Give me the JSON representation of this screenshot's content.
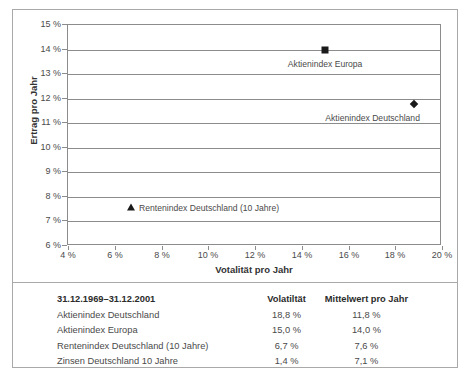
{
  "chart_data": {
    "type": "scatter",
    "title": "",
    "xlabel": "Votalität pro Jahr",
    "ylabel": "Ertrag pro Jahr",
    "xlim": [
      4,
      20
    ],
    "ylim": [
      6,
      15
    ],
    "xticks": [
      "4 %",
      "6 %",
      "8 %",
      "10 %",
      "12 %",
      "14 %",
      "16 %",
      "18 %",
      "20 %"
    ],
    "xtick_values": [
      4,
      6,
      8,
      10,
      12,
      14,
      16,
      18,
      20
    ],
    "yticks": [
      "6 %",
      "7 %",
      "8 %",
      "9 %",
      "10 %",
      "11 %",
      "12 %",
      "13 %",
      "14 %",
      "15 %"
    ],
    "ytick_values": [
      6,
      7,
      8,
      9,
      10,
      11,
      12,
      13,
      14,
      15
    ],
    "grid": "horizontal",
    "legend": "none",
    "points": [
      {
        "label": "Aktienindex Europa",
        "x": 15.0,
        "y": 14.0,
        "marker": "square",
        "label_align": "center",
        "label_dx": 0,
        "label_dy": 9
      },
      {
        "label": "Aktienindex Deutschland",
        "x": 18.8,
        "y": 11.8,
        "marker": "diamond",
        "label_align": "right",
        "label_dx": 6,
        "label_dy": 9
      },
      {
        "label": "Rentenindex Deutschland (10 Jahre)",
        "x": 6.7,
        "y": 7.6,
        "marker": "triangle",
        "label_align": "left",
        "label_dx": 8,
        "label_dy": -4
      }
    ]
  },
  "table": {
    "headers": {
      "period": "31.12.1969–31.12.2001",
      "volatility": "Volatiltät",
      "mean": "Mittelwert pro Jahr"
    },
    "rows": [
      {
        "name": "Aktienindex Deutschland",
        "volatility": "18,8 %",
        "mean": "11,8 %"
      },
      {
        "name": "Aktienindex Europa",
        "volatility": "15,0 %",
        "mean": "14,0 %"
      },
      {
        "name": "Rentenindex Deutschland (10 Jahre)",
        "volatility": "6,7 %",
        "mean": "7,6 %"
      },
      {
        "name": "Zinsen Deutschland 10 Jahre",
        "volatility": "1,4 %",
        "mean": "7,1 %"
      }
    ]
  },
  "colors": {
    "marker": "#1a1a1a",
    "gridline": "#8c8c8c",
    "border": "#a9a9a9",
    "text": "#4a4a4a"
  }
}
